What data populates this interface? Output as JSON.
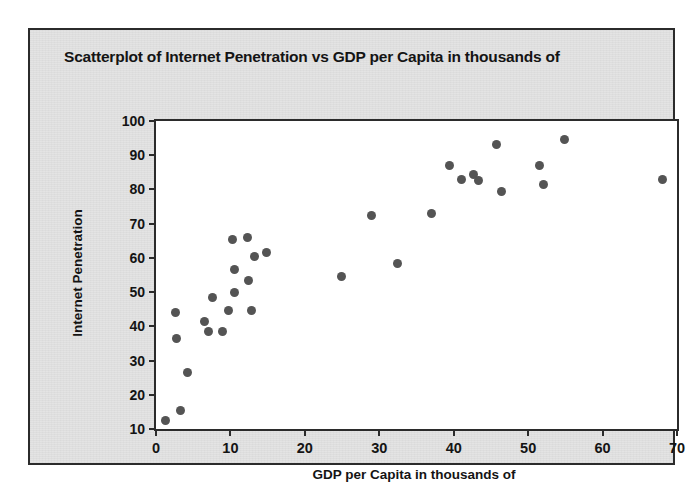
{
  "chart_data": {
    "type": "scatter",
    "title": "Scatterplot of Internet Penetration vs GDP per Capita in thousands of",
    "xlabel": "GDP per Capita in thousands of",
    "ylabel": "Internet Penetration",
    "xlim": [
      0,
      70
    ],
    "ylim": [
      10,
      100
    ],
    "xticks": [
      0,
      10,
      20,
      30,
      40,
      50,
      60,
      70
    ],
    "yticks": [
      10,
      20,
      30,
      40,
      50,
      60,
      70,
      80,
      90,
      100
    ],
    "grid": false,
    "legend": null,
    "marker_color": "#545454",
    "points": [
      {
        "x": 1.3,
        "y": 12.5
      },
      {
        "x": 3.3,
        "y": 15.5
      },
      {
        "x": 4.2,
        "y": 26.5
      },
      {
        "x": 2.6,
        "y": 44.0
      },
      {
        "x": 2.7,
        "y": 36.5
      },
      {
        "x": 6.5,
        "y": 41.5
      },
      {
        "x": 7.0,
        "y": 38.5
      },
      {
        "x": 7.6,
        "y": 48.5
      },
      {
        "x": 9.0,
        "y": 38.5
      },
      {
        "x": 9.7,
        "y": 44.5
      },
      {
        "x": 10.3,
        "y": 65.5
      },
      {
        "x": 10.5,
        "y": 56.5
      },
      {
        "x": 10.6,
        "y": 50.0
      },
      {
        "x": 12.3,
        "y": 66.0
      },
      {
        "x": 12.4,
        "y": 53.5
      },
      {
        "x": 12.8,
        "y": 44.5
      },
      {
        "x": 13.2,
        "y": 60.5
      },
      {
        "x": 14.8,
        "y": 61.5
      },
      {
        "x": 24.9,
        "y": 54.5
      },
      {
        "x": 29.0,
        "y": 72.5
      },
      {
        "x": 32.4,
        "y": 58.5
      },
      {
        "x": 37.0,
        "y": 73.0
      },
      {
        "x": 39.4,
        "y": 87.0
      },
      {
        "x": 41.0,
        "y": 83.0
      },
      {
        "x": 42.6,
        "y": 84.5
      },
      {
        "x": 43.3,
        "y": 82.5
      },
      {
        "x": 45.8,
        "y": 93.0
      },
      {
        "x": 46.4,
        "y": 79.5
      },
      {
        "x": 51.5,
        "y": 87.0
      },
      {
        "x": 52.0,
        "y": 81.5
      },
      {
        "x": 54.9,
        "y": 94.5
      },
      {
        "x": 68.0,
        "y": 83.0
      }
    ]
  }
}
